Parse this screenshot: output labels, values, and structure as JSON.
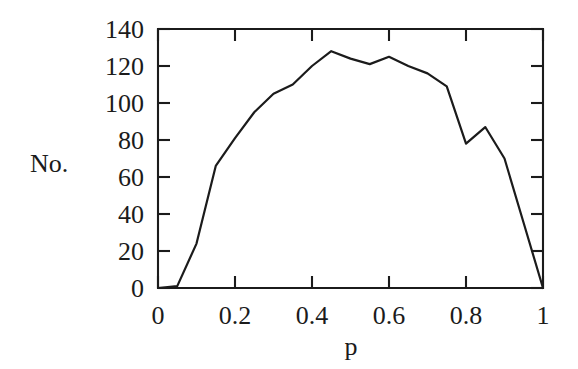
{
  "chart_data": {
    "type": "line",
    "title": "",
    "xlabel": "p",
    "ylabel": "No.",
    "xlim": [
      0,
      1
    ],
    "ylim": [
      0,
      140
    ],
    "grid": false,
    "legend": null,
    "x_ticks": [
      "0",
      "0.2",
      "0.4",
      "0.6",
      "0.8",
      "1"
    ],
    "x_tick_values": [
      0,
      0.2,
      0.4,
      0.6,
      0.8,
      1
    ],
    "y_ticks": [
      "0",
      "20",
      "40",
      "60",
      "80",
      "100",
      "120",
      "140"
    ],
    "y_tick_values": [
      0,
      20,
      40,
      60,
      80,
      100,
      120,
      140
    ],
    "x": [
      0.0,
      0.05,
      0.1,
      0.15,
      0.2,
      0.25,
      0.3,
      0.35,
      0.4,
      0.45,
      0.5,
      0.55,
      0.6,
      0.65,
      0.7,
      0.75,
      0.8,
      0.85,
      0.9,
      0.95,
      1.0
    ],
    "values": [
      0,
      1,
      24,
      66,
      81,
      95,
      105,
      110,
      120,
      128,
      124,
      121,
      125,
      120,
      116,
      109,
      78,
      87,
      70,
      35,
      0
    ],
    "series": [
      {
        "name": "No.",
        "x": [
          0.0,
          0.05,
          0.1,
          0.15,
          0.2,
          0.25,
          0.3,
          0.35,
          0.4,
          0.45,
          0.5,
          0.55,
          0.6,
          0.65,
          0.7,
          0.75,
          0.8,
          0.85,
          0.9,
          0.95,
          1.0
        ],
        "values": [
          0,
          1,
          24,
          66,
          81,
          95,
          105,
          110,
          120,
          128,
          124,
          121,
          125,
          120,
          116,
          109,
          78,
          87,
          70,
          35,
          0
        ]
      }
    ]
  },
  "axes": {
    "y_axis_title": "No.",
    "x_axis_title": "p"
  }
}
